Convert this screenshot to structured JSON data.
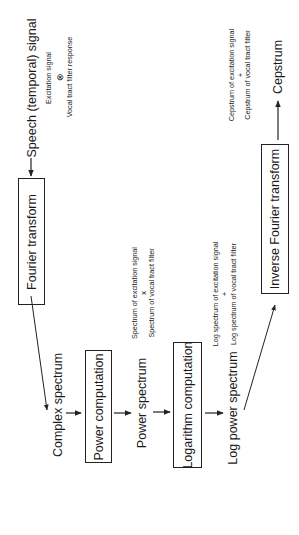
{
  "diagram": {
    "orientation": "rotated -90deg",
    "input": {
      "label": "Speech (temporal) signal",
      "note_line1": "Excitation signal",
      "note_operator": "⊗",
      "note_line2": "Vocal tract filter response"
    },
    "steps": [
      {
        "id": "fourier",
        "label": "Fourier transform"
      },
      {
        "id": "power",
        "label": "Power computation"
      },
      {
        "id": "log",
        "label": "Logarithm computation"
      },
      {
        "id": "inverse",
        "label": "Inverse Fourier transform"
      }
    ],
    "intermediates": {
      "complex": {
        "label": "Complex spectrum"
      },
      "power_spectrum": {
        "label": "Power spectrum",
        "note_line1": "Spectrum of excitation signal",
        "note_operator": "x",
        "note_line2": "Spectrum of vocal tract filter"
      },
      "log_power_spectrum": {
        "label": "Log power spectrum",
        "note_line1": "Log spectrum of excitation signal",
        "note_operator": "+",
        "note_line2": "Log spectrum of vocal tract filter"
      }
    },
    "output": {
      "label": "Cepstrum",
      "note_line1": "Cepstrum of excitation signal",
      "note_operator": "+",
      "note_line2": "Cepstrum of vocal tract filter"
    },
    "colors": {
      "line": "#222222",
      "text": "#1a1a1a",
      "background": "#ffffff"
    }
  }
}
